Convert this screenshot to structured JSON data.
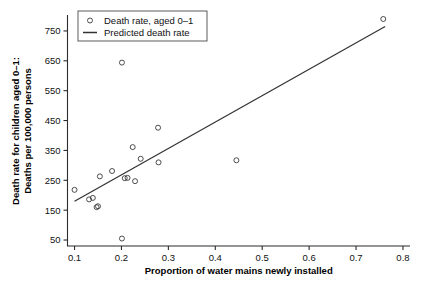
{
  "chart_data": {
    "type": "scatter",
    "title": "",
    "xlabel": "Proportion of water mains newly installed",
    "ylabel": "Death rate for children aged 0–1:\nDeaths per 100,000 persons",
    "ylabel_line1": "Death rate for children aged 0–1:",
    "ylabel_line2": "Deaths per 100,000 persons",
    "xlim": [
      0.085,
      0.815
    ],
    "ylim": [
      30,
      800
    ],
    "xticks": [
      0.1,
      0.2,
      0.3,
      0.4,
      0.5,
      0.6,
      0.7,
      0.8
    ],
    "xticklabels": [
      "0.1",
      "0.2",
      "0.3",
      "0.4",
      "0.5",
      "0.6",
      "0.7",
      "0.8"
    ],
    "yticks": [
      50,
      150,
      250,
      350,
      450,
      550,
      650,
      750
    ],
    "yticklabels": [
      "50",
      "150",
      "250",
      "350",
      "450",
      "550",
      "650",
      "750"
    ],
    "grid": false,
    "legend_position": "top-left",
    "legend": [
      {
        "label": "Death rate, aged 0–1",
        "type": "marker",
        "marker": "circle-open"
      },
      {
        "label": "Predicted death rate",
        "type": "line"
      }
    ],
    "series": [
      {
        "name": "Death rate, aged 0–1",
        "type": "scatter",
        "marker": "circle-open",
        "color": "#3a3a3a",
        "points": [
          {
            "x": 0.1,
            "y": 218
          },
          {
            "x": 0.131,
            "y": 186
          },
          {
            "x": 0.139,
            "y": 191
          },
          {
            "x": 0.147,
            "y": 160
          },
          {
            "x": 0.15,
            "y": 163
          },
          {
            "x": 0.154,
            "y": 263
          },
          {
            "x": 0.18,
            "y": 281
          },
          {
            "x": 0.201,
            "y": 644
          },
          {
            "x": 0.201,
            "y": 55
          },
          {
            "x": 0.207,
            "y": 257
          },
          {
            "x": 0.213,
            "y": 258
          },
          {
            "x": 0.224,
            "y": 361
          },
          {
            "x": 0.229,
            "y": 247
          },
          {
            "x": 0.241,
            "y": 322
          },
          {
            "x": 0.278,
            "y": 426
          },
          {
            "x": 0.279,
            "y": 310
          },
          {
            "x": 0.445,
            "y": 317
          },
          {
            "x": 0.758,
            "y": 790
          }
        ]
      },
      {
        "name": "Predicted death rate",
        "type": "line",
        "color": "#333333",
        "endpoints": [
          {
            "x": 0.1,
            "y": 180
          },
          {
            "x": 0.762,
            "y": 765
          }
        ],
        "slope": 884,
        "intercept": 92
      }
    ]
  }
}
